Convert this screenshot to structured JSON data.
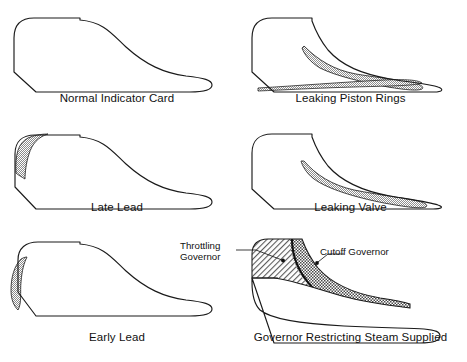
{
  "figure": {
    "stroke_color": "#1a1a1a",
    "shade_color": "#b9b9b9",
    "background": "#ffffff"
  },
  "cards": [
    {
      "id": "normal-indicator-card",
      "caption": "Normal Indicator Card",
      "shading": "none"
    },
    {
      "id": "leaking-piston-rings",
      "caption": "Leaking Piston Rings",
      "shading": "expansion-and-exhaust-line"
    },
    {
      "id": "late-lead",
      "caption": "Late Lead",
      "shading": "upper-left-corner"
    },
    {
      "id": "leaking-valve",
      "caption": "Leaking Valve",
      "shading": "expansion-line"
    },
    {
      "id": "early-lead",
      "caption": "Early Lead",
      "shading": "left-edge-outside"
    },
    {
      "id": "governor-restricting-steam-supplied",
      "caption": "Governor Restricting Steam Supplied",
      "shading": "two-hatched-regions"
    }
  ],
  "annotations": {
    "throttling": "Throttling\nGovernor",
    "cutoff": "Cutoff Governor"
  }
}
